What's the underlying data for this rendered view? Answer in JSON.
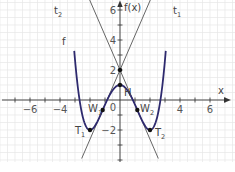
{
  "chart_data": {
    "type": "line",
    "title": "",
    "xlabel": "x",
    "ylabel": "f(x)",
    "xlim": [
      -8,
      7.7
    ],
    "ylim": [
      -4.1,
      6.7
    ],
    "grid": true,
    "grid_minor_step": 0.5,
    "x_ticks": [
      -6,
      -4,
      4,
      6
    ],
    "x_tick_labels": [
      "−6",
      "−4",
      "4",
      "6"
    ],
    "y_ticks": [
      6,
      4,
      2,
      -2
    ],
    "y_tick_labels": [
      "6",
      "4",
      "2",
      "−2"
    ],
    "origin_label": "0",
    "colors": {
      "function": "#2e2a6e",
      "tangent": "#555555",
      "grid": "#e6e6e6",
      "axis": "#333333",
      "text": "#555555"
    },
    "series": [
      {
        "name": "f",
        "label": "f",
        "expression": "f(x) = 3/16·x⁴ − 3/2·x² + 1",
        "domain": [
          -3.05,
          3.05
        ],
        "color": "#2e2a6e"
      },
      {
        "name": "t1",
        "label": "t",
        "label_sub": "1",
        "expression": "t1(x) = 2.309x + 2",
        "description": "tangent at inflection point W1",
        "color": "#555555"
      },
      {
        "name": "t2",
        "label": "t",
        "label_sub": "2",
        "expression": "t2(x) = −2.309x + 2",
        "description": "tangent at inflection point W2",
        "color": "#555555"
      }
    ],
    "points": [
      {
        "name": "H",
        "label": "H",
        "sub": "",
        "x": 0,
        "y": 1,
        "type": "local maximum"
      },
      {
        "name": "T1",
        "label": "T",
        "sub": "1",
        "x": -2,
        "y": -2,
        "type": "local minimum"
      },
      {
        "name": "T2",
        "label": "T",
        "sub": "2",
        "x": 2,
        "y": -2,
        "type": "local minimum"
      },
      {
        "name": "W1",
        "label": "W",
        "sub": "1",
        "x": -1.155,
        "y": -0.667,
        "type": "inflection point"
      },
      {
        "name": "W2",
        "label": "W",
        "sub": "2",
        "x": 1.155,
        "y": -0.667,
        "type": "inflection point"
      },
      {
        "name": "S",
        "label": "",
        "sub": "",
        "x": 0,
        "y": 2,
        "type": "intersection of tangents"
      }
    ],
    "annotations": [
      "t2",
      "t1",
      "f",
      "H",
      "W1",
      "W2",
      "T1",
      "T2",
      "x",
      "f(x)"
    ]
  },
  "labels": {
    "x_axis": "x",
    "y_axis": "f(x)",
    "f": "f",
    "t": "t",
    "t1_sub": "1",
    "t2_sub": "2",
    "H": "H",
    "W": "W",
    "T": "T",
    "sub1": "1",
    "sub2": "2",
    "origin": "0",
    "xt_m6": "−6",
    "xt_m4": "−4",
    "xt_4": "4",
    "xt_6": "6",
    "yt_6": "6",
    "yt_4": "4",
    "yt_2": "2",
    "yt_m2": "−2"
  }
}
